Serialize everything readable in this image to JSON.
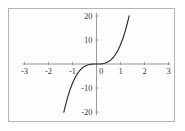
{
  "figure": {
    "frame_color": "#b4b4b4",
    "background_color": "#ffffff",
    "plot_background_color": "#fefefe"
  },
  "chart_data": {
    "type": "line",
    "title": "",
    "subtitle": "",
    "xlabel": "",
    "ylabel": "",
    "xlim": [
      -3,
      3
    ],
    "ylim": [
      -20,
      20
    ],
    "grid": false,
    "legend": null,
    "axis_color": "#8d8d8d",
    "curve_color": "#2b2b2b",
    "x_ticks": [
      -3,
      -2,
      -1,
      0,
      1,
      2,
      3
    ],
    "x_tick_labels": [
      "-3",
      "-2",
      "-1",
      "0",
      "1",
      "2",
      "3"
    ],
    "y_ticks": [
      -20,
      -10,
      10,
      20
    ],
    "y_tick_labels": [
      "-20",
      "-10",
      "10",
      "20"
    ],
    "series": [
      {
        "name": "y = 8x^3",
        "x": [
          -1.36,
          -1.3,
          -1.2,
          -1.1,
          -1.0,
          -0.9,
          -0.8,
          -0.7,
          -0.6,
          -0.5,
          -0.4,
          -0.3,
          -0.2,
          -0.1,
          0.0,
          0.1,
          0.2,
          0.3,
          0.4,
          0.5,
          0.6,
          0.7,
          0.8,
          0.9,
          1.0,
          1.1,
          1.2,
          1.3,
          1.36
        ],
        "y": [
          -20.1,
          -17.6,
          -13.8,
          -10.6,
          -8.0,
          -5.8,
          -4.1,
          -2.7,
          -1.7,
          -1.0,
          -0.5,
          -0.2,
          -0.06,
          -0.008,
          0.0,
          0.008,
          0.06,
          0.2,
          0.5,
          1.0,
          1.7,
          2.7,
          4.1,
          5.8,
          8.0,
          10.6,
          13.8,
          17.6,
          20.1
        ]
      }
    ],
    "annotations": []
  }
}
